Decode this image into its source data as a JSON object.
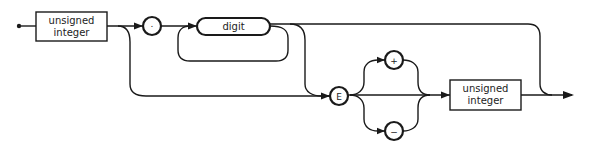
{
  "diagram": {
    "type": "syntax-railroad",
    "nodes": {
      "start_box": {
        "line1": "unsigned",
        "line2": "integer",
        "kind": "nonterminal"
      },
      "decimal_point": {
        "symbol": ".",
        "kind": "terminal"
      },
      "digit": {
        "label": "digit",
        "kind": "nonterminal-rounded"
      },
      "exponent": {
        "symbol": "E",
        "kind": "terminal"
      },
      "plus": {
        "symbol": "+",
        "kind": "terminal"
      },
      "minus": {
        "symbol": "−",
        "kind": "terminal"
      },
      "end_box": {
        "line1": "unsigned",
        "line2": "integer",
        "kind": "nonterminal"
      }
    },
    "colors": {
      "stroke": "#1a1a1a",
      "background": "#ffffff"
    }
  }
}
